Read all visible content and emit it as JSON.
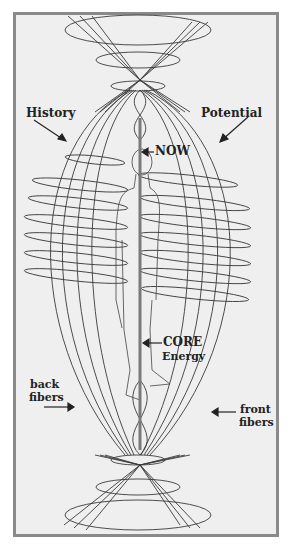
{
  "diagram": {
    "labels": {
      "history": "History",
      "potential": "Potential",
      "now": "NOW",
      "core_line1": "CORE",
      "core_line2": "Energy",
      "back_line1": "back",
      "back_line2": "fibers",
      "front_line1": "front",
      "front_line2": "fibers"
    },
    "colors": {
      "frame_border": "#8a8a8a",
      "background": "#efefef",
      "line": "#3a3a3a",
      "core": "#7a7a7a"
    }
  }
}
